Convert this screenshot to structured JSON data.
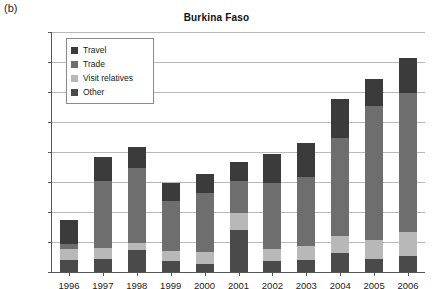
{
  "panel_label": "(b)",
  "chart_data": {
    "type": "bar",
    "barmode": "stacked",
    "title": "Burkina Faso",
    "xlabel": "",
    "ylabel": "",
    "ylim": [
      0,
      400000
    ],
    "ytick_step": 50000,
    "grid": true,
    "legend_position": "upper-left-inside",
    "categories": [
      "1996",
      "1997",
      "1998",
      "1999",
      "2000",
      "2001",
      "2002",
      "2003",
      "2004",
      "2005",
      "2006"
    ],
    "ytick_labels": [
      "0",
      "50000",
      "100000",
      "150000",
      "200000",
      "250000",
      "300000",
      "350000",
      "400000"
    ],
    "series": [
      {
        "name": "Other",
        "color": "#4a4a4a",
        "values": [
          20000,
          21000,
          36000,
          18000,
          14000,
          70000,
          18000,
          20000,
          31000,
          21000,
          27000
        ]
      },
      {
        "name": "Visit relatives",
        "color": "#b8b8b8",
        "values": [
          18000,
          19000,
          12000,
          17000,
          19000,
          28000,
          21000,
          23000,
          29000,
          32000,
          40000
        ]
      },
      {
        "name": "Trade",
        "color": "#6e6e6e",
        "values": [
          9000,
          111000,
          125000,
          83000,
          98000,
          54000,
          110000,
          115000,
          164000,
          223000,
          232000
        ]
      },
      {
        "name": "Travel",
        "color": "#3b3b3b",
        "values": [
          40000,
          41000,
          36000,
          31000,
          33000,
          31000,
          48000,
          57000,
          64000,
          46000,
          57000
        ]
      }
    ],
    "totals": [
      87000,
      192000,
      209000,
      149000,
      164000,
      183000,
      197000,
      215000,
      288000,
      322000,
      356000
    ]
  },
  "legend": {
    "items": [
      {
        "label": "Travel",
        "color": "#3b3b3b"
      },
      {
        "label": "Trade",
        "color": "#6e6e6e"
      },
      {
        "label": "Visit relatives",
        "color": "#b8b8b8"
      },
      {
        "label": "Other",
        "color": "#4a4a4a"
      }
    ]
  }
}
